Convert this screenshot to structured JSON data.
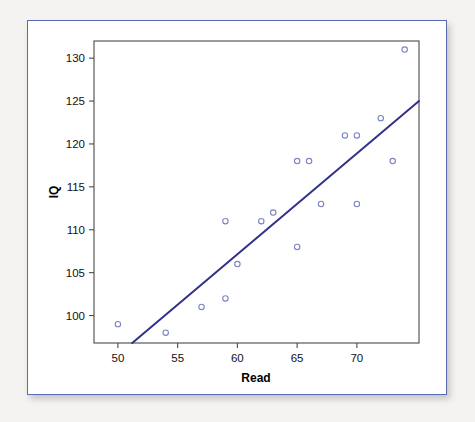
{
  "chart_data": {
    "type": "scatter",
    "title": "",
    "xlabel": "Read",
    "ylabel": "IQ",
    "xlim": [
      48.0,
      75.2
    ],
    "ylim": [
      96.8,
      132.0
    ],
    "grid": false,
    "legend": "none",
    "x_ticks": [
      50,
      55,
      60,
      65,
      70
    ],
    "y_ticks": [
      100,
      105,
      110,
      115,
      120,
      125,
      130
    ],
    "x_tick_labels": [
      "50",
      "55",
      "60",
      "65",
      "70"
    ],
    "y_tick_labels": [
      "100",
      "105",
      "110",
      "115",
      "120",
      "125",
      "130"
    ],
    "series": [
      {
        "name": "observations",
        "marker": "open-circle",
        "color": "#7b84c4",
        "points": [
          {
            "x": 50,
            "y": 99
          },
          {
            "x": 54,
            "y": 98
          },
          {
            "x": 57,
            "y": 101
          },
          {
            "x": 59,
            "y": 102
          },
          {
            "x": 59,
            "y": 111
          },
          {
            "x": 60,
            "y": 106
          },
          {
            "x": 62,
            "y": 111
          },
          {
            "x": 63,
            "y": 112
          },
          {
            "x": 65,
            "y": 108
          },
          {
            "x": 65,
            "y": 118
          },
          {
            "x": 66,
            "y": 118
          },
          {
            "x": 67,
            "y": 113
          },
          {
            "x": 69,
            "y": 121
          },
          {
            "x": 70,
            "y": 121
          },
          {
            "x": 70,
            "y": 113
          },
          {
            "x": 72,
            "y": 123
          },
          {
            "x": 73,
            "y": 118
          },
          {
            "x": 74,
            "y": 131
          }
        ]
      }
    ],
    "fit_line": {
      "name": "regression-line",
      "color": "#31318c",
      "x_start": 51.2,
      "y_start": 96.8,
      "x_end": 75.2,
      "y_end": 125.0
    },
    "colors": {
      "marker": "#7b84c4",
      "fit_line": "#31318c",
      "frame": "#4a4a4a",
      "card_border": "#5a6bb0",
      "background": "#ffffff",
      "page_background": "#f4f3f1"
    }
  }
}
